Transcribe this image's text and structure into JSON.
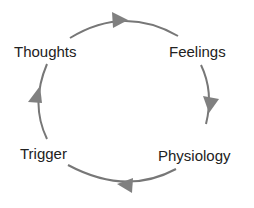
{
  "diagram": {
    "type": "cycle",
    "colors": {
      "arrow": "#777777",
      "text": "#222222",
      "background": "#ffffff"
    },
    "nodes": [
      {
        "id": "thoughts",
        "label": "Thoughts"
      },
      {
        "id": "feelings",
        "label": "Feelings"
      },
      {
        "id": "physiology",
        "label": "Physiology"
      },
      {
        "id": "trigger",
        "label": "Trigger"
      }
    ],
    "edges": [
      {
        "from": "Thoughts",
        "to": "Feelings"
      },
      {
        "from": "Feelings",
        "to": "Physiology"
      },
      {
        "from": "Physiology",
        "to": "Trigger"
      },
      {
        "from": "Trigger",
        "to": "Thoughts"
      }
    ]
  }
}
